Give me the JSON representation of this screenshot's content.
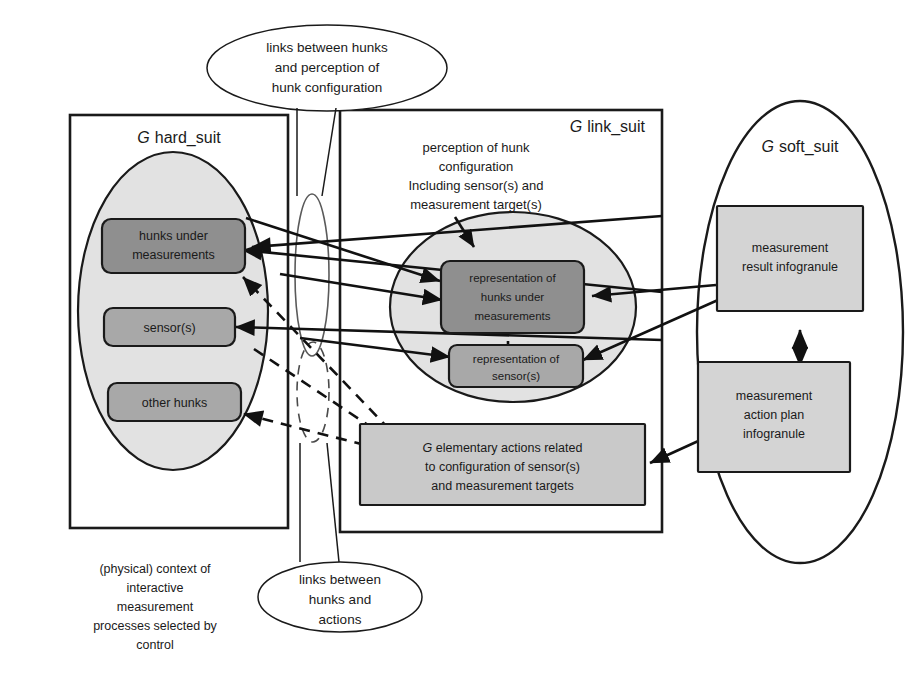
{
  "figure": {
    "background": "#ffffff"
  },
  "colors": {
    "stroke": "#1a1a1a",
    "grey_ellipse_fill": "#e2e2e2",
    "box_dark_fill": "#8f8f8f",
    "box_mid_fill": "#a8a8a8",
    "box_light_fill": "#c9c9c9",
    "box_pale_fill": "#d4d4d4"
  },
  "panels": {
    "hard_suit": {
      "title_g": "G",
      "title_rest": "hard_suit"
    },
    "link_suit": {
      "title_g": "G",
      "title_rest": "link_suit"
    },
    "soft_suit": {
      "title_g": "G",
      "title_rest": "soft_suit"
    }
  },
  "nodes": {
    "hunks_under_measurements": {
      "line1": "hunks under",
      "line2": "measurements"
    },
    "sensors": {
      "line1": "sensor(s)"
    },
    "other_hunks": {
      "line1": "other hunks"
    },
    "representation_hunks": {
      "line1": "representation of",
      "line2": "hunks under",
      "line3": "measurements"
    },
    "representation_sensors": {
      "line1": "representation of",
      "line2": "sensor(s)"
    },
    "elementary_actions": {
      "g": "G",
      "line1_rest": " elementary actions related",
      "line2": "to configuration of sensor(s)",
      "line3": "and measurement targets"
    },
    "measurement_result": {
      "line1": "measurement",
      "line2": "result infogranule"
    },
    "measurement_action_plan": {
      "line1": "measurement",
      "line2": "action plan",
      "line3": "infogranule"
    }
  },
  "annotations": {
    "perception_note": {
      "line1": "perception of hunk",
      "line2": "configuration",
      "line3": "Including sensor(s) and",
      "line4": "measurement target(s)"
    },
    "callout_top": {
      "line1": "links between hunks",
      "line2": "and  perception of",
      "line3": "hunk configuration"
    },
    "callout_bottom": {
      "line1": "links between",
      "line2": "hunks and",
      "line3": "actions"
    },
    "caption_left": {
      "line1": "(physical) context of",
      "line2": "interactive",
      "line3": "measurement",
      "line4": "processes selected by",
      "line5": "control"
    }
  }
}
